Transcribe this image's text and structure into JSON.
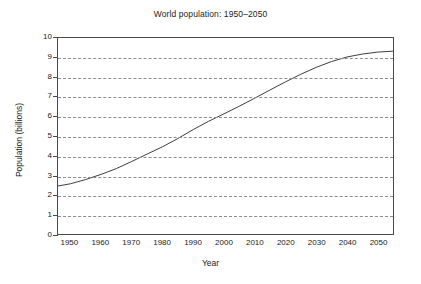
{
  "chart_data": {
    "type": "line",
    "title": "World population: 1950–2050",
    "xlabel": "Year",
    "ylabel": "Population (billions)",
    "xlim": [
      1946,
      2055
    ],
    "ylim": [
      0,
      10
    ],
    "grid": true,
    "grid_axis": "y",
    "grid_style": "dashed",
    "legend": "none",
    "line_color": "#3c3c3c",
    "xticks": [
      1950,
      1960,
      1970,
      1980,
      1990,
      2000,
      2010,
      2020,
      2030,
      2040,
      2050
    ],
    "xtick_labels": [
      "1950",
      "1960",
      "1970",
      "1980",
      "1990",
      "2000",
      "2010",
      "2020",
      "2030",
      "2040",
      "2050"
    ],
    "yticks": [
      0,
      1,
      2,
      3,
      4,
      5,
      6,
      7,
      8,
      9,
      10
    ],
    "ytick_labels": [
      "0",
      "1",
      "2",
      "3",
      "4",
      "5",
      "6",
      "7",
      "8",
      "9",
      "10"
    ],
    "x": [
      1946,
      1950,
      1955,
      1960,
      1965,
      1970,
      1975,
      1980,
      1985,
      1990,
      1995,
      2000,
      2005,
      2010,
      2015,
      2020,
      2025,
      2030,
      2035,
      2040,
      2045,
      2050,
      2055
    ],
    "values": [
      2.45,
      2.56,
      2.78,
      3.04,
      3.34,
      3.7,
      4.08,
      4.45,
      4.87,
      5.33,
      5.75,
      6.13,
      6.52,
      6.93,
      7.35,
      7.76,
      8.15,
      8.5,
      8.8,
      9.03,
      9.18,
      9.28,
      9.33
    ],
    "series_name": "World population"
  }
}
